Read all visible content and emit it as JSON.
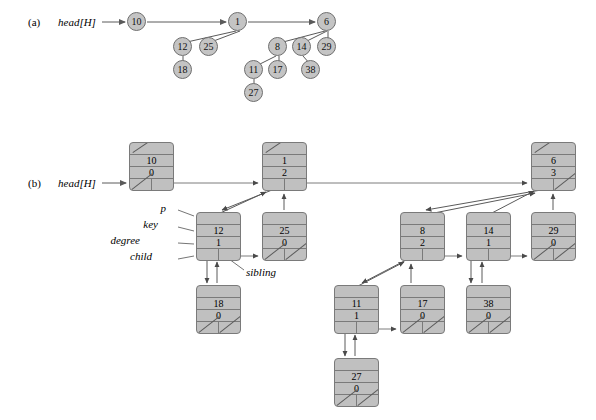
{
  "figure": {
    "panel_a_label": "(a)",
    "panel_b_label": "(b)",
    "head_pointer_a": "head[H]",
    "head_pointer_b": "head[H]"
  },
  "field_labels": {
    "p": "p",
    "key": "key",
    "degree": "degree",
    "child": "child",
    "sibling": "sibling"
  },
  "colors": {
    "node_fill": "#c0c0c0",
    "node_stroke": "#7a7a7a",
    "circle_fill": "#c4c4c4",
    "circle_stroke": "#6f6f6f",
    "wire": "#6a6a6a",
    "text": "#111111",
    "background": "#ffffff"
  },
  "panel_a": {
    "roots": [
      "10",
      "1",
      "6"
    ],
    "circles": [
      {
        "key": "10",
        "x": 137,
        "y": 22
      },
      {
        "key": "1",
        "x": 238,
        "y": 22
      },
      {
        "key": "6",
        "x": 327,
        "y": 22
      },
      {
        "key": "12",
        "x": 183,
        "y": 47
      },
      {
        "key": "25",
        "x": 209,
        "y": 47
      },
      {
        "key": "8",
        "x": 278,
        "y": 47
      },
      {
        "key": "14",
        "x": 302,
        "y": 47
      },
      {
        "key": "29",
        "x": 327,
        "y": 47
      },
      {
        "key": "18",
        "x": 183,
        "y": 70
      },
      {
        "key": "11",
        "x": 254,
        "y": 70
      },
      {
        "key": "17",
        "x": 278,
        "y": 70
      },
      {
        "key": "38",
        "x": 311,
        "y": 70
      },
      {
        "key": "27",
        "x": 254,
        "y": 93
      }
    ],
    "edges": [
      [
        "1",
        "12"
      ],
      [
        "1",
        "25"
      ],
      [
        "12",
        "18"
      ],
      [
        "6",
        "8"
      ],
      [
        "6",
        "14"
      ],
      [
        "6",
        "29"
      ],
      [
        "8",
        "11"
      ],
      [
        "8",
        "17"
      ],
      [
        "14",
        "38"
      ],
      [
        "11",
        "27"
      ]
    ],
    "root_list": [
      "10",
      "1",
      "6"
    ]
  },
  "panel_b": {
    "nodes": [
      {
        "id": "n10",
        "key": "10",
        "degree": "0",
        "x": 129,
        "y": 142,
        "p_nil": true,
        "child_nil": true,
        "sibling_nil": false
      },
      {
        "id": "n1",
        "key": "1",
        "degree": "2",
        "x": 262,
        "y": 142,
        "p_nil": true,
        "child_nil": false,
        "sibling_nil": false
      },
      {
        "id": "n6",
        "key": "6",
        "degree": "3",
        "x": 531,
        "y": 142,
        "p_nil": true,
        "child_nil": false,
        "sibling_nil": true
      },
      {
        "id": "n12",
        "key": "12",
        "degree": "1",
        "x": 196,
        "y": 212,
        "p_nil": false,
        "child_nil": false,
        "sibling_nil": false
      },
      {
        "id": "n25",
        "key": "25",
        "degree": "0",
        "x": 262,
        "y": 212,
        "p_nil": false,
        "child_nil": true,
        "sibling_nil": true
      },
      {
        "id": "n8",
        "key": "8",
        "degree": "2",
        "x": 400,
        "y": 212,
        "p_nil": false,
        "child_nil": false,
        "sibling_nil": false
      },
      {
        "id": "n14",
        "key": "14",
        "degree": "1",
        "x": 466,
        "y": 212,
        "p_nil": false,
        "child_nil": false,
        "sibling_nil": false
      },
      {
        "id": "n29",
        "key": "29",
        "degree": "0",
        "x": 531,
        "y": 212,
        "p_nil": false,
        "child_nil": true,
        "sibling_nil": true
      },
      {
        "id": "n18",
        "key": "18",
        "degree": "0",
        "x": 196,
        "y": 285,
        "p_nil": false,
        "child_nil": true,
        "sibling_nil": true
      },
      {
        "id": "n11",
        "key": "11",
        "degree": "1",
        "x": 334,
        "y": 285,
        "p_nil": false,
        "child_nil": false,
        "sibling_nil": false
      },
      {
        "id": "n17",
        "key": "17",
        "degree": "0",
        "x": 400,
        "y": 285,
        "p_nil": false,
        "child_nil": true,
        "sibling_nil": true
      },
      {
        "id": "n38",
        "key": "38",
        "degree": "0",
        "x": 466,
        "y": 285,
        "p_nil": false,
        "child_nil": true,
        "sibling_nil": true
      },
      {
        "id": "n27",
        "key": "27",
        "degree": "0",
        "x": 334,
        "y": 358,
        "p_nil": false,
        "child_nil": true,
        "sibling_nil": true
      }
    ],
    "root_list_order": [
      "n10",
      "n1",
      "n6"
    ],
    "annotations": [
      {
        "label": "p",
        "x": 166,
        "y": 208
      },
      {
        "label": "key",
        "x": 158,
        "y": 224
      },
      {
        "label": "degree",
        "x": 140,
        "y": 240
      },
      {
        "label": "child",
        "x": 152,
        "y": 256
      },
      {
        "label": "sibling",
        "x": 246,
        "y": 272
      }
    ]
  }
}
